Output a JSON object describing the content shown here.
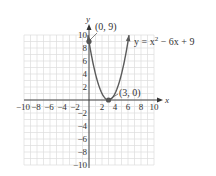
{
  "chart_data": {
    "type": "line",
    "title": "",
    "xlabel": "x",
    "ylabel": "y",
    "xlim": [
      -10,
      10
    ],
    "ylim": [
      -10,
      10
    ],
    "grid": true,
    "x_ticks": [
      -10,
      -8,
      -6,
      -4,
      -2,
      2,
      4,
      6,
      8,
      10
    ],
    "y_ticks": [
      -10,
      -8,
      -6,
      -4,
      -2,
      2,
      4,
      6,
      8,
      10
    ],
    "x_tick_labels": [
      "−10",
      "−8",
      "−6",
      "−4",
      "−2",
      "2",
      "4",
      "6",
      "8",
      "10"
    ],
    "y_tick_labels": [
      "−10",
      "−8",
      "−6",
      "−4",
      "−2",
      "2",
      "4",
      "6",
      "8",
      "10"
    ],
    "series": [
      {
        "name": "y = x² − 6x + 9",
        "equation": "y = x^2 - 6x + 9",
        "x": [
          -0.16,
          0,
          0.5,
          1,
          1.5,
          2,
          2.5,
          3,
          3.5,
          4,
          4.5,
          5,
          5.5,
          6,
          6.16
        ],
        "y": [
          10,
          9,
          6.25,
          4,
          2.25,
          1,
          0.25,
          0,
          0.25,
          1,
          2.25,
          4,
          6.25,
          9,
          10
        ]
      }
    ],
    "points": [
      {
        "x": 0,
        "y": 9,
        "label": "(0, 9)"
      },
      {
        "x": 3,
        "y": 0,
        "label": "(3, 0)"
      }
    ],
    "annotations": [
      {
        "text": "(0, 9)",
        "target": [
          0,
          9
        ]
      },
      {
        "text": "(3, 0)",
        "target": [
          3,
          0
        ]
      },
      {
        "text": "y = x² − 6x + 9",
        "target": "curve"
      }
    ],
    "colors": {
      "curve": "#5a5a5a",
      "axes": "#333333",
      "grid": "#dcdcdc",
      "point": "#555555"
    }
  },
  "labels": {
    "x_axis": "x",
    "y_axis": "y",
    "point_vertex": "(3, 0)",
    "point_intercept": "(0, 9)",
    "equation_main": "y = x",
    "equation_sup": "2",
    "equation_rest": " − 6x + 9"
  },
  "ticks": {
    "x": [
      "−10",
      "−8",
      "−6",
      "−4",
      "−2",
      "2",
      "4",
      "6",
      "8",
      "10"
    ],
    "y_pos": [
      "2",
      "4",
      "6",
      "8",
      "10"
    ],
    "y_neg": [
      "−2",
      "−4",
      "−6",
      "−8",
      "−10"
    ]
  }
}
